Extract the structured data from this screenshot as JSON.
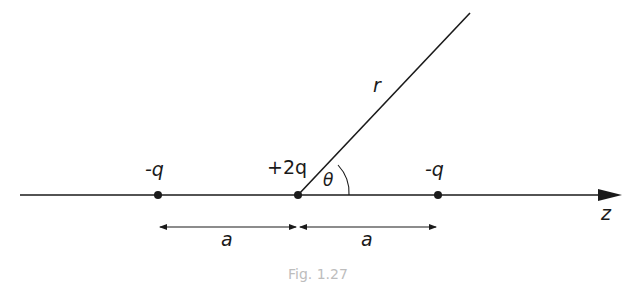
{
  "diagram": {
    "axis": {
      "label": "z"
    },
    "charges": [
      {
        "label": "-q",
        "position": "left"
      },
      {
        "label": "+2q",
        "position": "center"
      },
      {
        "label": "-q",
        "position": "right"
      }
    ],
    "radial_line": {
      "label": "r",
      "angle_label": "θ"
    },
    "spacing": [
      {
        "label": "a",
        "from": "left",
        "to": "center"
      },
      {
        "label": "a",
        "from": "center",
        "to": "right"
      }
    ],
    "caption": "Fig. 1.27",
    "colors": {
      "ink": "#1a1a1a",
      "background": "#ffffff"
    }
  }
}
